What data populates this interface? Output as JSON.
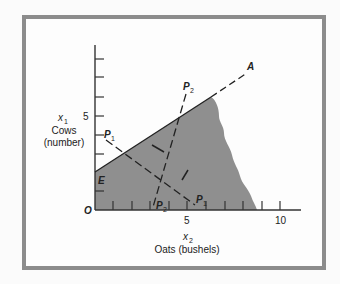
{
  "figure": {
    "y_axis": {
      "variable": "x",
      "variable_sub": "1",
      "label_line1": "Cows",
      "label_line2": "(number)",
      "tick_label_5": "5"
    },
    "x_axis": {
      "variable": "x",
      "variable_sub": "2",
      "label": "Oats (bushels)",
      "tick_label_5": "5",
      "tick_label_10": "10"
    },
    "origin_label": "O",
    "points": {
      "A": "A",
      "E": "E",
      "P1": "P",
      "P1_sub": "1",
      "P2": "P",
      "P2_sub": "2"
    },
    "colors": {
      "feasible_region": "#8f8f8f",
      "frame": "#8c8c8c",
      "lines": "#222222"
    }
  }
}
